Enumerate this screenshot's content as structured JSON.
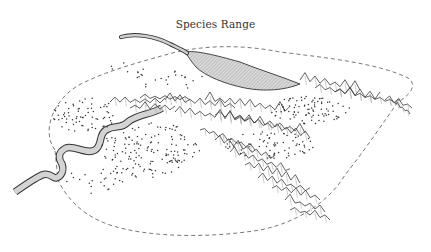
{
  "map": {
    "title": "Species Range",
    "features": {
      "range_boundary": "dashed-outline",
      "river": "hatched-river",
      "lake": "hatched-lake",
      "mountains": "ridge-lines",
      "populations": "stippled-dots"
    },
    "colors": {
      "ink": "#333333",
      "water_fill": "#cfcfcf",
      "background": "#ffffff"
    }
  }
}
